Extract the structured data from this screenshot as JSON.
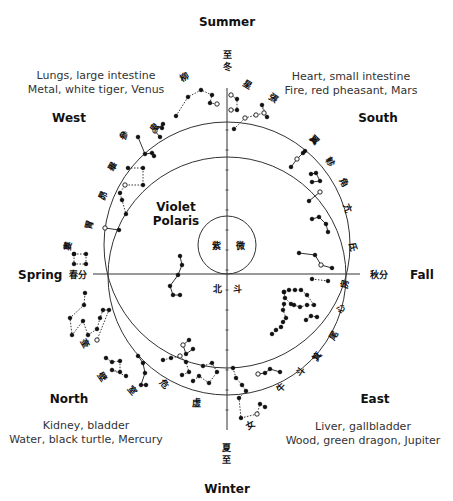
{
  "diagram": {
    "center_label": [
      "Violet",
      "Polaris"
    ],
    "seasons": {
      "top": "Summer",
      "bottom": "Winter",
      "left": "Spring",
      "right": "Fall"
    },
    "directions": {
      "west": {
        "name": "West",
        "organs": "Lungs, large intestine",
        "element": "Metal, white tiger, Venus"
      },
      "south": {
        "name": "South",
        "organs": "Heart, small intestine",
        "element": "Fire, red pheasant, Mars"
      },
      "north": {
        "name": "North",
        "organs": "Kidney, bladder",
        "element": "Water, black turtle, Mercury"
      },
      "east": {
        "name": "East",
        "organs": "Liver, gallbladder",
        "element": "Wood, green dragon, Jupiter"
      }
    },
    "solstice_glyphs": {
      "top": [
        "至",
        "冬"
      ],
      "bottom": [
        "夏",
        "至"
      ],
      "left": "春分",
      "right": "秋分"
    },
    "inner_glyphs": {
      "in_small_circle": [
        "紫",
        "微"
      ],
      "below_axis": [
        "北",
        "斗"
      ]
    },
    "mansion_glyphs": [
      {
        "ch": "柳",
        "x": 186,
        "y": 80,
        "rot": -30
      },
      {
        "ch": "鬼",
        "x": 157,
        "y": 130,
        "rot": -50
      },
      {
        "ch": "參",
        "x": 127,
        "y": 137,
        "rot": -55
      },
      {
        "ch": "畢",
        "x": 115,
        "y": 168,
        "rot": -60
      },
      {
        "ch": "昴",
        "x": 106,
        "y": 197,
        "rot": -65
      },
      {
        "ch": "胃",
        "x": 92,
        "y": 226,
        "rot": -75
      },
      {
        "ch": "婁",
        "x": 71,
        "y": 247,
        "rot": -80
      },
      {
        "ch": "奎",
        "x": 82,
        "y": 345,
        "rot": 60
      },
      {
        "ch": "壁",
        "x": 100,
        "y": 379,
        "rot": 55
      },
      {
        "ch": "室",
        "x": 130,
        "y": 392,
        "rot": 50
      },
      {
        "ch": "危",
        "x": 162,
        "y": 386,
        "rot": 45
      },
      {
        "ch": "虛",
        "x": 196,
        "y": 406,
        "rot": 0
      },
      {
        "ch": "星",
        "x": 246,
        "y": 87,
        "rot": 30
      },
      {
        "ch": "張",
        "x": 272,
        "y": 101,
        "rot": 35
      },
      {
        "ch": "翼",
        "x": 312,
        "y": 142,
        "rot": 45
      },
      {
        "ch": "軫",
        "x": 328,
        "y": 164,
        "rot": 55
      },
      {
        "ch": "角",
        "x": 341,
        "y": 184,
        "rot": 60
      },
      {
        "ch": "亢",
        "x": 345,
        "y": 209,
        "rot": 70
      },
      {
        "ch": "氐",
        "x": 350,
        "y": 247,
        "rot": 80
      },
      {
        "ch": "房",
        "x": 348,
        "y": 285,
        "rot": -80
      },
      {
        "ch": "心",
        "x": 344,
        "y": 310,
        "rot": -70
      },
      {
        "ch": "尾",
        "x": 336,
        "y": 337,
        "rot": -60
      },
      {
        "ch": "箕",
        "x": 320,
        "y": 358,
        "rot": -55
      },
      {
        "ch": "斗",
        "x": 303,
        "y": 374,
        "rot": -50
      },
      {
        "ch": "牛",
        "x": 283,
        "y": 390,
        "rot": -45
      },
      {
        "ch": "女",
        "x": 252,
        "y": 428,
        "rot": -30
      }
    ],
    "geometry": {
      "axis_color": "#333333",
      "ink_color": "#111111",
      "text_color": "#333333",
      "vertical_axis": {
        "x": 227,
        "y1": 88,
        "y2": 430
      },
      "horizontal_axis": {
        "y": 274,
        "x1": 93,
        "x2": 360
      },
      "circle_upper": {
        "cx": 227,
        "cy": 245,
        "r": 123
      },
      "circle_lower": {
        "cx": 227,
        "cy": 276,
        "r": 119
      },
      "circle_polaris": {
        "cx": 227,
        "cy": 245,
        "r": 29
      }
    },
    "constellations": [
      {
        "name": "upper-left-arc",
        "points": [
          [
            176,
            116
          ],
          [
            188,
            97
          ],
          [
            201,
            90
          ],
          [
            212,
            95
          ],
          [
            210,
            103
          ],
          [
            217,
            104
          ]
        ],
        "dotted": true,
        "hollow": [
          5
        ]
      },
      {
        "name": "west-1",
        "points": [
          [
            162,
            128
          ],
          [
            163,
            124
          ],
          [
            155,
            131
          ],
          [
            160,
            137
          ]
        ],
        "dotted": false,
        "hollow": [
          2
        ]
      },
      {
        "name": "west-2",
        "points": [
          [
            138,
            137
          ],
          [
            145,
            154
          ],
          [
            152,
            153
          ],
          [
            154,
            156
          ]
        ],
        "dotted": false,
        "hollow": []
      },
      {
        "name": "west-3",
        "points": [
          [
            128,
            168
          ],
          [
            143,
            168
          ],
          [
            143,
            185
          ],
          [
            125,
            185
          ],
          [
            120,
            193
          ],
          [
            122,
            200
          ],
          [
            126,
            214
          ]
        ],
        "dotted": true,
        "hollow": [
          3
        ]
      },
      {
        "name": "west-4",
        "points": [
          [
            105,
            228
          ],
          [
            119,
            230
          ]
        ],
        "dotted": false,
        "hollow": [
          0
        ]
      },
      {
        "name": "spring-sq",
        "points": [
          [
            74,
            254
          ],
          [
            86,
            254
          ],
          [
            86,
            264
          ],
          [
            74,
            264
          ],
          [
            74,
            254
          ]
        ],
        "dotted": true,
        "hollow": []
      },
      {
        "name": "north-zig",
        "points": [
          [
            85,
            293
          ],
          [
            84,
            305
          ],
          [
            70,
            318
          ],
          [
            72,
            335
          ],
          [
            83,
            321
          ],
          [
            88,
            335
          ],
          [
            97,
            329
          ],
          [
            100,
            318
          ],
          [
            103,
            310
          ],
          [
            109,
            310
          ],
          [
            97,
            340
          ]
        ],
        "dotted": true,
        "hollow": [
          10
        ]
      },
      {
        "name": "north-sq",
        "points": [
          [
            106,
            358
          ],
          [
            112,
            362
          ],
          [
            120,
            361
          ],
          [
            120,
            372
          ],
          [
            112,
            370
          ],
          [
            126,
            376
          ]
        ],
        "dotted": true,
        "hollow": []
      },
      {
        "name": "north-2",
        "points": [
          [
            138,
            356
          ],
          [
            143,
            363
          ],
          [
            145,
            373
          ],
          [
            141,
            385
          ],
          [
            146,
            385
          ]
        ],
        "dotted": false,
        "hollow": []
      },
      {
        "name": "north-3",
        "points": [
          [
            163,
            360
          ],
          [
            171,
            358
          ],
          [
            180,
            356
          ],
          [
            186,
            362
          ],
          [
            189,
            372
          ],
          [
            182,
            375
          ]
        ],
        "dotted": true,
        "hollow": [
          2
        ]
      },
      {
        "name": "north-4",
        "points": [
          [
            189,
            340
          ],
          [
            183,
            345
          ],
          [
            186,
            354
          ],
          [
            193,
            349
          ]
        ],
        "dotted": false,
        "hollow": [
          1
        ]
      },
      {
        "name": "north-5",
        "points": [
          [
            203,
            366
          ],
          [
            212,
            363
          ],
          [
            217,
            372
          ],
          [
            209,
            383
          ],
          [
            199,
            376
          ],
          [
            193,
            381
          ]
        ],
        "dotted": true,
        "hollow": []
      },
      {
        "name": "bottom-chain",
        "points": [
          [
            233,
            368
          ],
          [
            236,
            378
          ],
          [
            242,
            385
          ],
          [
            246,
            391
          ],
          [
            239,
            398
          ],
          [
            241,
            418
          ],
          [
            257,
            414
          ],
          [
            260,
            404
          ],
          [
            265,
            407
          ]
        ],
        "dotted": true,
        "hollow": [
          6
        ]
      },
      {
        "name": "east-small",
        "points": [
          [
            258,
            374
          ],
          [
            265,
            373
          ],
          [
            270,
            369
          ],
          [
            280,
            372
          ]
        ],
        "dotted": false,
        "hollow": [
          0
        ]
      },
      {
        "name": "east-ladder",
        "points": [
          [
            272,
            334
          ],
          [
            276,
            330
          ],
          [
            281,
            327
          ],
          [
            283,
            322
          ],
          [
            286,
            318
          ],
          [
            283,
            310
          ],
          [
            284,
            304
          ]
        ],
        "dotted": true,
        "hollow": []
      },
      {
        "name": "east-hex",
        "points": [
          [
            284,
            292
          ],
          [
            289,
            290
          ],
          [
            295,
            290
          ],
          [
            301,
            290
          ],
          [
            307,
            295
          ],
          [
            314,
            305
          ],
          [
            307,
            305
          ],
          [
            300,
            307
          ],
          [
            294,
            305
          ],
          [
            291,
            304
          ],
          [
            285,
            298
          ],
          [
            284,
            292
          ]
        ],
        "dotted": true,
        "hollow": []
      },
      {
        "name": "east-2",
        "points": [
          [
            306,
            320
          ],
          [
            311,
            316
          ],
          [
            317,
            317
          ]
        ],
        "dotted": true,
        "hollow": []
      },
      {
        "name": "fall-line",
        "points": [
          [
            312,
            279
          ],
          [
            328,
            281
          ]
        ],
        "dotted": true,
        "hollow": []
      },
      {
        "name": "south-1",
        "points": [
          [
            299,
            253
          ],
          [
            315,
            255
          ],
          [
            321,
            265
          ],
          [
            332,
            268
          ]
        ],
        "dotted": false,
        "hollow": [
          2
        ]
      },
      {
        "name": "south-2",
        "points": [
          [
            312,
            219
          ],
          [
            319,
            217
          ],
          [
            326,
            224
          ],
          [
            328,
            232
          ]
        ],
        "dotted": false,
        "hollow": []
      },
      {
        "name": "south-3",
        "points": [
          [
            309,
            201
          ],
          [
            320,
            192
          ]
        ],
        "dotted": false,
        "hollow": [
          1
        ]
      },
      {
        "name": "south-4",
        "points": [
          [
            311,
            174
          ],
          [
            316,
            173
          ],
          [
            320,
            181
          ],
          [
            312,
            182
          ]
        ],
        "dotted": false,
        "hollow": []
      },
      {
        "name": "south-5",
        "points": [
          [
            291,
            167
          ],
          [
            297,
            159
          ],
          [
            303,
            153
          ],
          [
            305,
            151
          ]
        ],
        "dotted": false,
        "hollow": [
          1
        ]
      },
      {
        "name": "south-6",
        "points": [
          [
            234,
            129
          ],
          [
            245,
            118
          ],
          [
            256,
            115
          ],
          [
            264,
            113
          ],
          [
            262,
            105
          ],
          [
            267,
            117
          ]
        ],
        "dotted": true,
        "hollow": [
          1,
          2,
          3
        ]
      },
      {
        "name": "center-chain",
        "points": [
          [
            180,
            256
          ],
          [
            182,
            265
          ],
          [
            178,
            275
          ],
          [
            170,
            286
          ],
          [
            173,
            295
          ],
          [
            180,
            295
          ]
        ],
        "dotted": false,
        "hollow": []
      },
      {
        "name": "summer-chain",
        "points": [
          [
            231,
            95
          ],
          [
            237,
            99
          ],
          [
            237,
            110
          ],
          [
            231,
            110
          ]
        ],
        "dotted": true,
        "hollow": [
          0,
          3
        ]
      }
    ]
  }
}
